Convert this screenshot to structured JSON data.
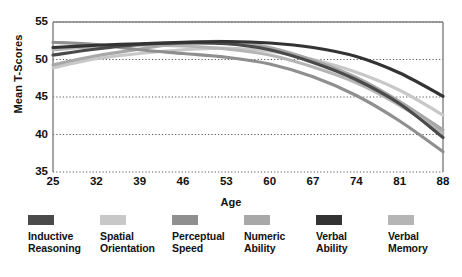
{
  "chart_data": {
    "type": "line",
    "title": "",
    "xlabel": "Age",
    "ylabel": "Mean T-Scores",
    "xlim": [
      25,
      88
    ],
    "ylim": [
      35,
      55
    ],
    "grid": true,
    "legend_position": "bottom",
    "x_ticks": [
      "25",
      "32",
      "39",
      "46",
      "53",
      "60",
      "67",
      "74",
      "81",
      "88"
    ],
    "y_ticks": [
      "55",
      "50",
      "45",
      "40",
      "35"
    ],
    "x": [
      25,
      32,
      39,
      46,
      53,
      60,
      67,
      74,
      81,
      88
    ],
    "series": [
      {
        "name": "Inductive Reasoning",
        "color": "#4a4a4a",
        "values": [
          50.6,
          51.4,
          52.0,
          52.2,
          52.1,
          51.3,
          49.6,
          47.3,
          44.1,
          39.6
        ]
      },
      {
        "name": "Spatial Orientation",
        "color": "#c8c8c8",
        "values": [
          48.9,
          50.1,
          50.8,
          51.3,
          51.5,
          51.1,
          50.0,
          48.3,
          45.9,
          42.6
        ]
      },
      {
        "name": "Perceptual Speed",
        "color": "#8f8f8f",
        "values": [
          52.3,
          52.0,
          51.3,
          50.8,
          50.3,
          49.4,
          47.7,
          45.2,
          41.8,
          37.7
        ]
      },
      {
        "name": "Numeric Ability",
        "color": "#a8a8a8",
        "values": [
          49.3,
          50.5,
          51.4,
          52.2,
          52.4,
          51.6,
          49.9,
          47.6,
          44.4,
          40.6
        ]
      },
      {
        "name": "Verbal Ability",
        "color": "#333333",
        "values": [
          51.6,
          51.9,
          52.1,
          52.3,
          52.4,
          52.2,
          51.6,
          50.4,
          48.2,
          45.1
        ]
      },
      {
        "name": "Verbal Memory",
        "color": "#b5b5b5",
        "values": [
          51.3,
          51.7,
          51.9,
          51.8,
          51.4,
          50.6,
          49.0,
          46.9,
          43.9,
          40.2
        ]
      }
    ]
  },
  "legend": {
    "items": [
      {
        "label": "Inductive\nReasoning",
        "color": "#4a4a4a"
      },
      {
        "label": "Spatial\nOrientation",
        "color": "#c8c8c8"
      },
      {
        "label": "Perceptual\nSpeed",
        "color": "#8f8f8f"
      },
      {
        "label": "Numeric\nAbility",
        "color": "#a8a8a8"
      },
      {
        "label": "Verbal\nAbility",
        "color": "#333333"
      },
      {
        "label": "Verbal\nMemory",
        "color": "#b5b5b5"
      }
    ]
  },
  "axes": {
    "frame_color": "#808080",
    "grid_color": "#555555",
    "background": "#ffffff"
  }
}
